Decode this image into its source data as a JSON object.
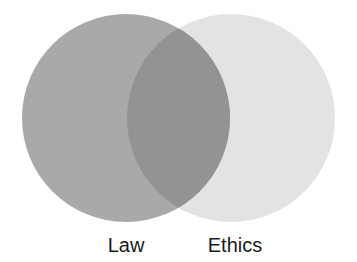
{
  "diagram": {
    "type": "venn",
    "sets": [
      {
        "label": "Law",
        "color": "#a9a9a9",
        "cx": 126,
        "cy": 118,
        "r": 104
      },
      {
        "label": "Ethics",
        "color": "#e3e3e3",
        "cx": 231,
        "cy": 118,
        "r": 104
      }
    ],
    "overlap_color": "#939393"
  }
}
